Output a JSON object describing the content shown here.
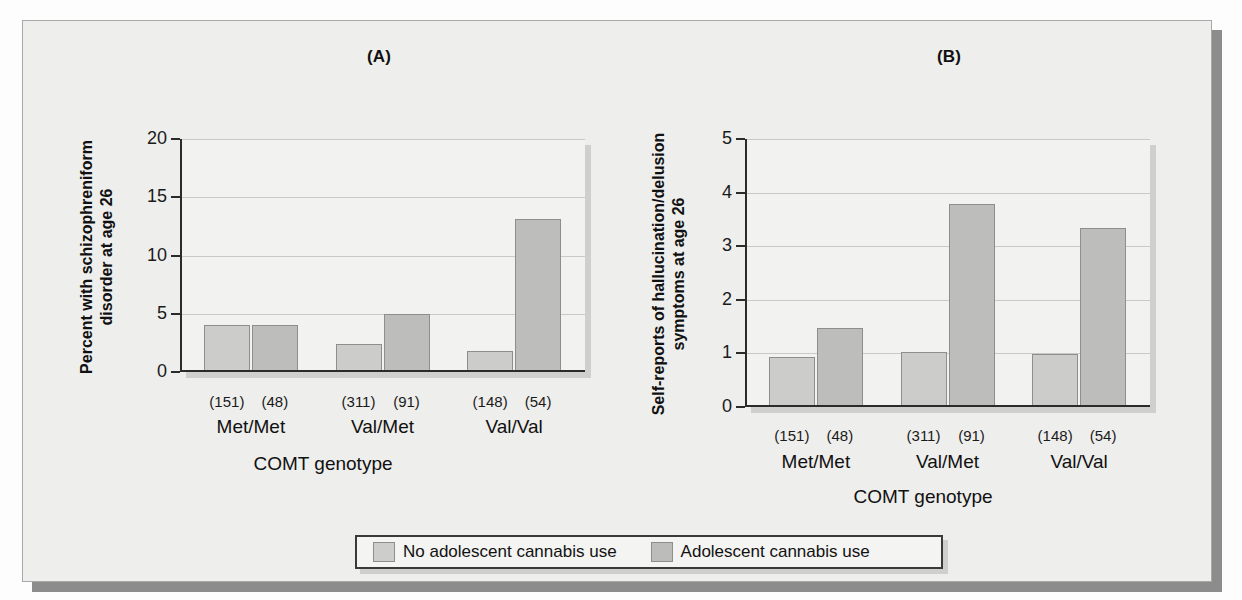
{
  "figure": {
    "background_color": "#eeeeec",
    "border_color": "#a9a9a9",
    "shadow_color": "#8c8c8c"
  },
  "legend": {
    "items": [
      {
        "label": "No adolescent cannabis use",
        "swatch": "light",
        "color": "#cdcdcc"
      },
      {
        "label": "Adolescent cannabis use",
        "swatch": "dark",
        "color": "#bcbcbb"
      }
    ]
  },
  "panels": [
    {
      "key": "A",
      "title": "(A)",
      "ylabel": "Percent with schizophreniform\ndisorder at age 26",
      "xlabel": "COMT genotype"
    },
    {
      "key": "B",
      "title": "(B)",
      "ylabel": "Self-reports of hallucination/delusion\nsymptoms at age 26",
      "xlabel": "COMT genotype"
    }
  ],
  "chart_data": [
    {
      "type": "bar",
      "title": "(A)",
      "xlabel": "COMT genotype",
      "ylabel": "Percent with schizophreniform disorder at age 26",
      "categories": [
        "Met/Met",
        "Val/Met",
        "Val/Val"
      ],
      "group_ns": [
        [
          "(151)",
          "(48)"
        ],
        [
          "(311)",
          "(91)"
        ],
        [
          "(148)",
          "(54)"
        ]
      ],
      "series": [
        {
          "name": "No adolescent cannabis use",
          "values": [
            4.0,
            2.4,
            1.8
          ],
          "n": [
            151,
            311,
            148
          ],
          "color": "#cccccb"
        },
        {
          "name": "Adolescent cannabis use",
          "values": [
            4.0,
            5.0,
            13.1
          ],
          "n": [
            48,
            91,
            54
          ],
          "color": "#bdbdbc"
        }
      ],
      "ylim": [
        0,
        20
      ],
      "yticks": [
        0,
        5,
        10,
        15,
        20
      ],
      "ytick_labels": [
        "0",
        "5",
        "10",
        "15",
        "20"
      ],
      "grid": true,
      "legend_position": "bottom-center"
    },
    {
      "type": "bar",
      "title": "(B)",
      "xlabel": "COMT genotype",
      "ylabel": "Self-reports of hallucination/delusion symptoms at age 26",
      "categories": [
        "Met/Met",
        "Val/Met",
        "Val/Val"
      ],
      "group_ns": [
        [
          "(151)",
          "(48)"
        ],
        [
          "(311)",
          "(91)"
        ],
        [
          "(148)",
          "(54)"
        ]
      ],
      "series": [
        {
          "name": "No adolescent cannabis use",
          "values": [
            0.93,
            1.03,
            0.99
          ],
          "n": [
            151,
            311,
            148
          ],
          "color": "#cccccb"
        },
        {
          "name": "Adolescent cannabis use",
          "values": [
            1.47,
            3.78,
            3.34
          ],
          "n": [
            48,
            91,
            54
          ],
          "color": "#bdbdbc"
        }
      ],
      "ylim": [
        0,
        5
      ],
      "yticks": [
        0,
        1,
        2,
        3,
        4,
        5
      ],
      "ytick_labels": [
        "0",
        "1",
        "2",
        "3",
        "4",
        "5"
      ],
      "grid": true,
      "legend_position": "bottom-center"
    }
  ]
}
